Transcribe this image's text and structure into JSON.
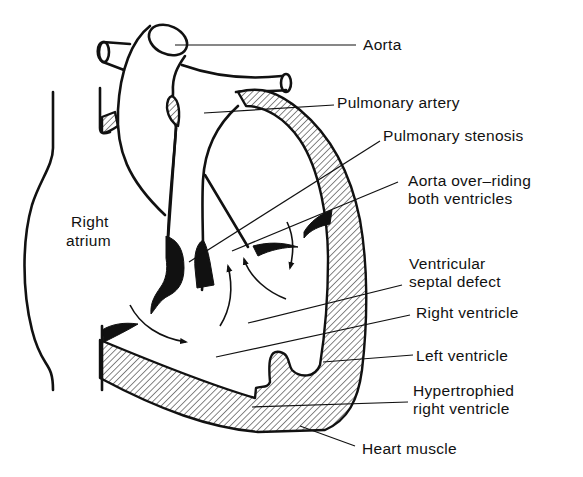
{
  "diagram": {
    "labels": {
      "aorta": "Aorta",
      "pulmonary_artery": "Pulmonary artery",
      "pulmonary_stenosis": "Pulmonary stenosis",
      "aorta_overriding_line1": "Aorta over–riding",
      "aorta_overriding_line2": "both ventricles",
      "right_atrium_line1": "Right",
      "right_atrium_line2": "atrium",
      "vsd_line1": "Ventricular",
      "vsd_line2": "septal defect",
      "right_ventricle": "Right ventricle",
      "left_ventricle": "Left ventricle",
      "hypertrophied_line1": "Hypertrophied",
      "hypertrophied_line2": "right ventricle",
      "heart_muscle": "Heart muscle"
    },
    "colors": {
      "ink": "#111111",
      "background": "#ffffff"
    }
  }
}
